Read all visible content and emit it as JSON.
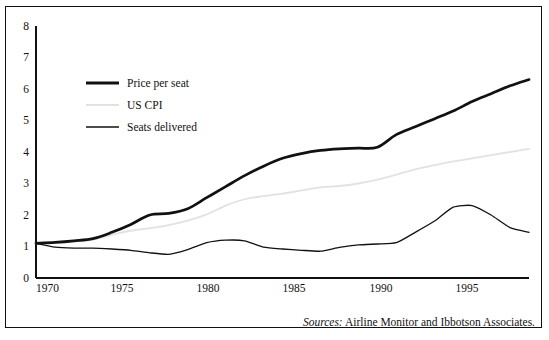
{
  "figure": {
    "source_prefix": "Sources:",
    "source_text": "Airline Monitor and Ibbotson Associates."
  },
  "axes": {
    "y_ticks": [
      "0",
      "1",
      "2",
      "3",
      "4",
      "5",
      "6",
      "7",
      "8"
    ],
    "x_ticks": [
      "1970",
      "1975",
      "1980",
      "1985",
      "1990",
      "1995"
    ]
  },
  "legend": {
    "items": [
      {
        "label": "Price per seat",
        "color": "#111111",
        "width": 2.6
      },
      {
        "label": "US CPI",
        "color": "#e2e2e2",
        "width": 1.6
      },
      {
        "label": "Seats delivered",
        "color": "#111111",
        "width": 1.2
      }
    ]
  },
  "chart_data": {
    "type": "line",
    "title": "",
    "xlabel": "",
    "ylabel": "",
    "xlim": [
      1970,
      1996
    ],
    "ylim": [
      0,
      8
    ],
    "grid": false,
    "legend_position": "upper-left-inside",
    "x": [
      1970,
      1971,
      1972,
      1973,
      1974,
      1975,
      1976,
      1977,
      1978,
      1979,
      1980,
      1981,
      1982,
      1983,
      1984,
      1985,
      1986,
      1987,
      1988,
      1989,
      1990,
      1991,
      1992,
      1993,
      1994,
      1995,
      1996
    ],
    "series": [
      {
        "name": "Price per seat",
        "color": "#111111",
        "values": [
          1.1,
          1.13,
          1.18,
          1.25,
          1.45,
          1.7,
          2.0,
          2.05,
          2.2,
          2.55,
          2.9,
          3.25,
          3.55,
          3.8,
          3.95,
          4.05,
          4.1,
          4.12,
          4.15,
          4.55,
          4.8,
          5.05,
          5.3,
          5.6,
          5.85,
          6.1,
          6.3
        ]
      },
      {
        "name": "US CPI",
        "color": "#e2e2e2",
        "values": [
          1.1,
          1.12,
          1.16,
          1.22,
          1.37,
          1.5,
          1.58,
          1.68,
          1.82,
          2.02,
          2.3,
          2.5,
          2.6,
          2.68,
          2.78,
          2.88,
          2.92,
          3.0,
          3.12,
          3.28,
          3.45,
          3.58,
          3.7,
          3.8,
          3.9,
          4.0,
          4.1
        ]
      },
      {
        "name": "Seats delivered",
        "color": "#111111",
        "values": [
          1.1,
          0.98,
          0.95,
          0.95,
          0.92,
          0.88,
          0.8,
          0.75,
          0.9,
          1.12,
          1.2,
          1.18,
          0.98,
          0.92,
          0.88,
          0.85,
          0.97,
          1.05,
          1.08,
          1.12,
          1.45,
          1.8,
          2.25,
          2.3,
          2.0,
          1.6,
          1.45
        ]
      }
    ],
    "annotations": [
      {
        "text": "Sources: Airline Monitor and Ibbotson Associates.",
        "position": "bottom-right"
      }
    ]
  }
}
